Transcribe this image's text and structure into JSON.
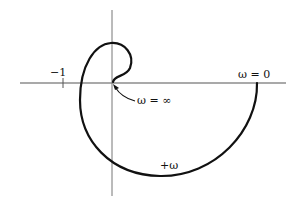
{
  "diagram": {
    "type": "nyquist-plot",
    "labels": {
      "minus_one": "−1",
      "omega_zero": "ω  =  0",
      "omega_infinity": "ω  =  ∞",
      "plus_omega": "+ω"
    },
    "colors": {
      "curve": "#111111",
      "axis": "#555555",
      "background": "#ffffff"
    }
  }
}
